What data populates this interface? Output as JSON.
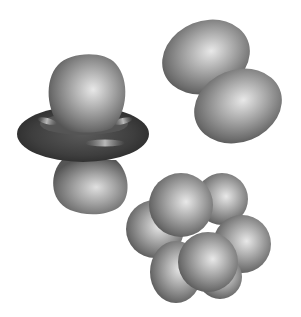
{
  "figure": {
    "title": "Atomic orbital shapes",
    "background": "#ffffff",
    "shape_color_light": "#e6e6e6",
    "shape_color_mid": "#9a9a9a",
    "shape_color_dark": "#4a4a4a",
    "torus_color": "#3c3c3c",
    "orbitals": [
      {
        "name": "dz2-orbital",
        "description": "two lobes along axis with a dark torus ring around the middle"
      },
      {
        "name": "p-orbital",
        "description": "two ellipsoidal lobes, diagonal orientation"
      },
      {
        "name": "f-orbital",
        "description": "cluster of seven overlapping spherical lobes"
      }
    ]
  }
}
